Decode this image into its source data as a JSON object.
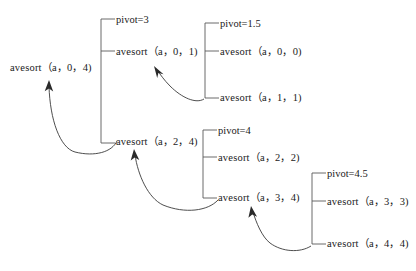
{
  "diagram": {
    "nodes": [
      {
        "id": "root",
        "text": "avesort（a，0，4)",
        "x": 10,
        "y": 62
      },
      {
        "id": "pivot3",
        "text": "pivot=3",
        "x": 116,
        "y": 14
      },
      {
        "id": "n-0-1",
        "text": "avesort（a，0，1)",
        "x": 116,
        "y": 46
      },
      {
        "id": "n-2-4",
        "text": "avesort（a，2，4)",
        "x": 116,
        "y": 136
      },
      {
        "id": "pivot15",
        "text": "pivot=1.5",
        "x": 220,
        "y": 18
      },
      {
        "id": "n-0-0",
        "text": "avesort（a，0，0)",
        "x": 220,
        "y": 46
      },
      {
        "id": "n-1-1",
        "text": "avesort（a，1，1)",
        "x": 220,
        "y": 92
      },
      {
        "id": "pivot4",
        "text": "pivot=4",
        "x": 218,
        "y": 125
      },
      {
        "id": "n-2-2",
        "text": "avesort（a，2，2)",
        "x": 218,
        "y": 152
      },
      {
        "id": "n-3-4",
        "text": "avesort（a，3，4)",
        "x": 218,
        "y": 192
      },
      {
        "id": "pivot45",
        "text": "pivot=4.5",
        "x": 327,
        "y": 168
      },
      {
        "id": "n-3-3",
        "text": "avesort（a，3，3)",
        "x": 327,
        "y": 196
      },
      {
        "id": "n-4-4",
        "text": "avesort（a，4，4)",
        "x": 327,
        "y": 238
      }
    ],
    "brackets": [
      {
        "id": "bracket-root",
        "x": 101,
        "top": 19,
        "bottom": 143,
        "tick": 14,
        "ticks": [
          19,
          51,
          143
        ]
      },
      {
        "id": "bracket-0-1",
        "x": 205,
        "top": 23,
        "bottom": 98,
        "tick": 14,
        "ticks": [
          23,
          51,
          98
        ]
      },
      {
        "id": "bracket-2-4",
        "x": 203,
        "top": 130,
        "bottom": 198,
        "tick": 14,
        "ticks": [
          130,
          157,
          198
        ]
      },
      {
        "id": "bracket-3-4",
        "x": 312,
        "top": 173,
        "bottom": 244,
        "tick": 14,
        "ticks": [
          173,
          201,
          244
        ]
      }
    ],
    "arrows": [
      {
        "id": "return-to-root",
        "from": "n-2-4",
        "to": "root"
      },
      {
        "id": "return-to-0-1",
        "from": "n-1-1",
        "to": "n-0-1"
      },
      {
        "id": "return-to-2-4",
        "from": "n-3-4",
        "to": "n-2-4"
      },
      {
        "id": "return-to-3-4",
        "from": "n-4-4",
        "to": "n-3-4"
      }
    ],
    "colors": {
      "background": "#ffffff",
      "text": "#1a1a1a",
      "bracket": "#5a5a5a",
      "arrow": "#3a3a3a"
    }
  }
}
